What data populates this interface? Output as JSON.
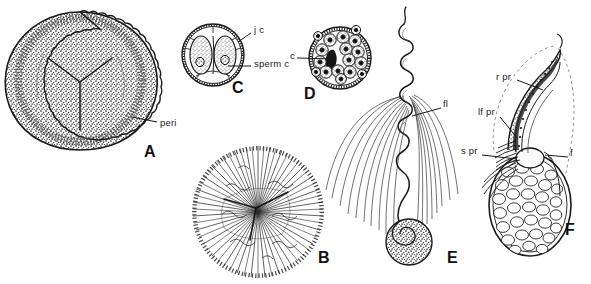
{
  "figure": {
    "type": "scientific-line-drawing-plate",
    "background_color": "#ffffff",
    "ink_color": "#1a1a1a",
    "width": 591,
    "height": 284,
    "panel_count": 6
  },
  "panels": [
    {
      "letter": "A",
      "name": "spore-with-perispore",
      "description": "Circular spore in surface view with dense stippled ornamentation and a trilete Y-shaped laesura at the centre; outer crenulate perispore layer.",
      "letter_x": 144,
      "letter_y": 144,
      "center": {
        "x": 80,
        "y": 80
      },
      "radius": 68
    },
    {
      "letter": "B",
      "name": "spore-radiate-perispore",
      "description": "Circular spore with radiating filamentous perispore fringe and central trilete mark.",
      "letter_x": 318,
      "letter_y": 250,
      "center": {
        "x": 258,
        "y": 212
      },
      "radius": 66
    },
    {
      "letter": "C",
      "name": "two-celled-spermatogenous-stage",
      "description": "Spherical antheridium-like body containing two large oval sperm cells, each with a nucleus, enclosed by a jacket cell layer.",
      "letter_x": 232,
      "letter_y": 80,
      "center": {
        "x": 213,
        "y": 55
      },
      "radius": 37
    },
    {
      "letter": "D",
      "name": "multicellular-spermatogenous-stage",
      "description": "Spherical body packed with many stippled spermatogenous cells, each with a dark nucleus, and a dark central wedge.",
      "letter_x": 304,
      "letter_y": 86,
      "center": {
        "x": 340,
        "y": 58
      },
      "radius": 37
    },
    {
      "letter": "E",
      "name": "mature-multiflagellate-spermatozoid",
      "description": "Mature spermatozoid: helically coiled body with a stippled spherical vesicle at the posterior end and a dense tuft of long flagella.",
      "letter_x": 447,
      "letter_y": 265,
      "center": {
        "x": 403,
        "y": 140
      }
    },
    {
      "letter": "F",
      "name": "spermatozoid-ultrastructure",
      "description": "Sectional reconstruction of the spermatozoid anterior: coiled multilayered structure with ribbon, lamellar strip and spline processes, flagella, and a vacuolate cytoplasmic body.",
      "letter_x": 565,
      "letter_y": 238,
      "center": {
        "x": 530,
        "y": 150
      }
    }
  ],
  "labels": [
    {
      "id": "peri",
      "text": "peri",
      "panel": "A",
      "x": 160,
      "y": 124,
      "leader_to": {
        "x": 134,
        "y": 119
      }
    },
    {
      "id": "jc",
      "text": "j c",
      "panel": "C",
      "x": 254,
      "y": 30,
      "leader_to": {
        "x": 242,
        "y": 40
      }
    },
    {
      "id": "spermc",
      "text": "sperm c",
      "panel": "C",
      "x": 254,
      "y": 64,
      "leader_to": {
        "x": 229,
        "y": 66
      }
    },
    {
      "id": "c",
      "text": "c",
      "panel": "D",
      "x": 292,
      "y": 56,
      "leader_to": {
        "x": 335,
        "y": 60
      }
    },
    {
      "id": "fl",
      "text": "fl",
      "panel": "E",
      "x": 443,
      "y": 104,
      "leader_to": {
        "x": 412,
        "y": 116
      }
    },
    {
      "id": "rpr",
      "text": "r pr",
      "panel": "F",
      "x": 496,
      "y": 77,
      "leader_to": {
        "x": 543,
        "y": 92
      }
    },
    {
      "id": "lfpr",
      "text": "lf pr",
      "panel": "F",
      "x": 479,
      "y": 112,
      "leader_to": {
        "x": 516,
        "y": 138
      }
    },
    {
      "id": "spr",
      "text": "s pr",
      "panel": "F",
      "x": 462,
      "y": 151,
      "leader_to": {
        "x": 515,
        "y": 157
      }
    },
    {
      "id": "f",
      "text": "f",
      "panel": "F",
      "x": 571,
      "y": 153,
      "leader_to": {
        "x": 545,
        "y": 152
      }
    }
  ],
  "label_glossary": {
    "peri": "perispore",
    "j c": "jacket cell",
    "sperm c": "sperm cell",
    "c": "cell",
    "fl": "flagella",
    "r pr": "ribbon process",
    "lf pr": "lamellar process",
    "s pr": "spline process",
    "f": "flagellum"
  }
}
